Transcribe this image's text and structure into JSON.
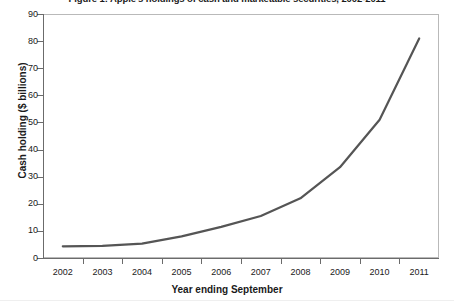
{
  "chart_data": {
    "type": "line",
    "title": "Figure 1: Apple's holdings of cash and marketable securities, 2002-2011",
    "xlabel": "Year ending September",
    "ylabel": "Cash holding ($ billions)",
    "categories": [
      "2002",
      "2003",
      "2004",
      "2005",
      "2006",
      "2007",
      "2008",
      "2009",
      "2010",
      "2011"
    ],
    "values": [
      4.3,
      4.5,
      5.3,
      8.0,
      11.5,
      15.5,
      22.0,
      33.5,
      51.0,
      81.0
    ],
    "series": [
      {
        "name": "Cash and marketable securities",
        "values": [
          4.3,
          4.5,
          5.3,
          8.0,
          11.5,
          15.5,
          22.0,
          33.5,
          51.0,
          81.0
        ],
        "color": "#555555"
      }
    ],
    "ylim": [
      0,
      90
    ],
    "yticks": [
      0,
      10,
      20,
      30,
      40,
      50,
      60,
      70,
      80,
      90
    ],
    "ytick_labels": [
      "0",
      "10",
      "20",
      "30",
      "40",
      "50",
      "60",
      "70",
      "80",
      "90"
    ],
    "grid": false,
    "legend": false,
    "legend_position": "none",
    "line_width": 2.2,
    "markers": false
  },
  "colors": {
    "line": "#555555",
    "axis": "#6b6b6b",
    "frame": "#b9b9b9",
    "text": "#1a1a1a",
    "background": "#ffffff"
  }
}
